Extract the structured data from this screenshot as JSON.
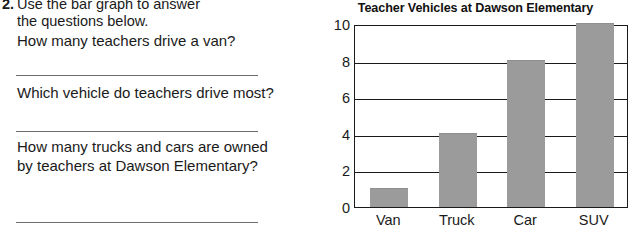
{
  "worksheet": {
    "question_number": "2.",
    "prompt_line_1": "Use the bar graph to answer",
    "prompt_line_2": "the questions below.",
    "questions": [
      {
        "text": "How many teachers drive a van?"
      },
      {
        "text": "Which vehicle do teachers drive most?"
      },
      {
        "text": "How many trucks and cars are owned by teachers at Dawson Elementary?"
      }
    ],
    "answer_line_label": "answer-blank"
  },
  "chart_data": {
    "type": "bar",
    "title": "Teacher Vehicles at Dawson Elementary",
    "categories": [
      "Van",
      "Truck",
      "Car",
      "SUV"
    ],
    "values": [
      1,
      4,
      8,
      10
    ],
    "xlabel": "",
    "ylabel": "",
    "ylim": [
      0,
      10
    ],
    "yticks": [
      0,
      2,
      4,
      6,
      8,
      10
    ],
    "grid": true,
    "legend": "none",
    "bar_color": "#9b9b9b",
    "axis_color": "#1a1a1a"
  }
}
